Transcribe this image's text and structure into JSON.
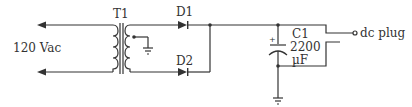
{
  "diagram": {
    "type": "circuit-schematic",
    "colors": {
      "wire": "#333333",
      "background": "#ffffff"
    },
    "labels": {
      "input": "120 Vac",
      "transformer": "T1",
      "diode1": "D1",
      "diode2": "D2",
      "capacitor": "C1",
      "capacitor_value": "2200",
      "capacitor_unit": "µF",
      "capacitor_polarity": "+",
      "output": "dc plug"
    },
    "components": [
      {
        "id": "T1",
        "kind": "transformer",
        "detail": "center-tapped secondary, tap grounded"
      },
      {
        "id": "D1",
        "kind": "diode"
      },
      {
        "id": "D2",
        "kind": "diode"
      },
      {
        "id": "C1",
        "kind": "electrolytic-capacitor",
        "value": "2200 µF"
      },
      {
        "id": "ground-1",
        "kind": "ground",
        "at": "transformer center tap"
      },
      {
        "id": "ground-2",
        "kind": "ground",
        "at": "capacitor negative"
      },
      {
        "id": "dc-plug",
        "kind": "output-connector"
      }
    ]
  }
}
